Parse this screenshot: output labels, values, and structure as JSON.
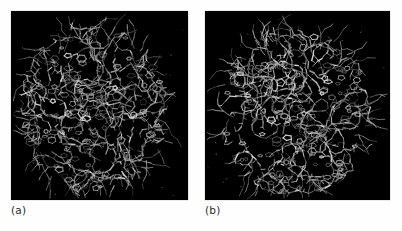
{
  "figure": {
    "background_color": "#fefefe",
    "panel_background_color": "#000000",
    "caption_color": "#2b2b2b",
    "panels": [
      {
        "id": "panel-a",
        "caption": "(a)",
        "content_type": "molecular-structure-stick-model",
        "description": "dense grayscale wireframe protein structure on black background",
        "structure_color_bright": "#d9d9d9",
        "structure_color_mid": "#9a9a9a",
        "structure_color_dim": "#5e5e5e",
        "seed": 1701,
        "center_x": 0.47,
        "center_y": 0.52,
        "radius_x": 0.4,
        "radius_y": 0.43,
        "density": 1.0
      },
      {
        "id": "panel-b",
        "caption": "(b)",
        "content_type": "molecular-structure-stick-model",
        "description": "dense grayscale wireframe protein structure on black background, rotated view",
        "structure_color_bright": "#dedede",
        "structure_color_mid": "#a2a2a2",
        "structure_color_dim": "#606060",
        "seed": 9312,
        "center_x": 0.49,
        "center_y": 0.54,
        "radius_x": 0.4,
        "radius_y": 0.42,
        "density": 1.0
      }
    ]
  }
}
